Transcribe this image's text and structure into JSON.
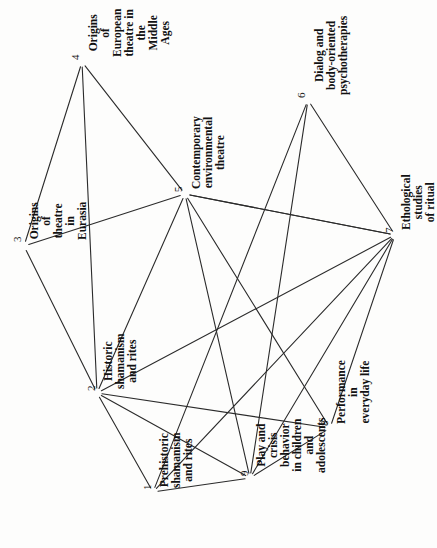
{
  "diagram": {
    "type": "node-link-graph",
    "canvas": {
      "width": 437,
      "height": 548
    },
    "orientation": "labels-rotated-90-ccw",
    "line_color": "#2b2b2b",
    "text_color": "#121212",
    "background": "#fdfdfc",
    "nodes": [
      {
        "id": "1",
        "number": "1",
        "label": "Prehistoric shamanism\nand rites",
        "x": 153,
        "y": 492,
        "num_dx": -12,
        "num_dy": -2,
        "text_dx": 6,
        "text_dy": -4
      },
      {
        "id": "2",
        "number": "2",
        "label": "Historic shamanism\nand rites",
        "x": 97,
        "y": 393,
        "num_dx": -12,
        "num_dy": -2,
        "text_dx": 6,
        "text_dy": -4
      },
      {
        "id": "3",
        "number": "3",
        "label": "Origins of theatre\nin Eurasia",
        "x": 24,
        "y": 246,
        "num_dx": -13,
        "num_dy": -4,
        "text_dx": 5,
        "text_dy": -6
      },
      {
        "id": "4",
        "number": "4",
        "label": "Origins of European\ntheatre in the\nMiddle Ages",
        "x": 82,
        "y": 62,
        "num_dx": -13,
        "num_dy": -2,
        "text_dx": 6,
        "text_dy": -5
      },
      {
        "id": "5",
        "number": "5",
        "label": "Contemporary\nenvironmental theatre",
        "x": 185,
        "y": 194,
        "num_dx": -13,
        "num_dy": -2,
        "text_dx": 6,
        "text_dy": -5
      },
      {
        "id": "6",
        "number": "6",
        "label": "Dialog and body-oriented\npsychotherapies",
        "x": 308,
        "y": 100,
        "num_dx": -13,
        "num_dy": -2,
        "text_dx": 6,
        "text_dy": -5
      },
      {
        "id": "7",
        "number": "7",
        "label": "Ethological studies\nof ritual",
        "x": 395,
        "y": 235,
        "num_dx": -12,
        "num_dy": -2,
        "text_dx": 6,
        "text_dy": -5
      },
      {
        "id": "8",
        "number": "8",
        "label": "Performance in\neveryday life",
        "x": 330,
        "y": 428,
        "num_dx": -12,
        "num_dy": -2,
        "text_dx": 6,
        "text_dy": -4
      },
      {
        "id": "9",
        "number": "9",
        "label": "Play and crisis behavior\nin children and adolescents",
        "x": 250,
        "y": 478,
        "num_dx": -12,
        "num_dy": -2,
        "text_dx": 6,
        "text_dy": -5
      }
    ],
    "edges": [
      {
        "from": "3",
        "to": "4"
      },
      {
        "from": "3",
        "to": "5"
      },
      {
        "from": "3",
        "to": "2"
      },
      {
        "from": "4",
        "to": "5"
      },
      {
        "from": "4",
        "to": "2"
      },
      {
        "from": "5",
        "to": "2"
      },
      {
        "from": "5",
        "to": "9"
      },
      {
        "from": "5",
        "to": "8"
      },
      {
        "from": "5",
        "to": "7"
      },
      {
        "from": "6",
        "to": "7"
      },
      {
        "from": "6",
        "to": "9"
      },
      {
        "from": "6",
        "to": "1"
      },
      {
        "from": "7",
        "to": "2"
      },
      {
        "from": "7",
        "to": "1"
      },
      {
        "from": "7",
        "to": "9"
      },
      {
        "from": "7",
        "to": "8"
      },
      {
        "from": "7",
        "to": "5"
      },
      {
        "from": "2",
        "to": "1"
      },
      {
        "from": "2",
        "to": "9"
      },
      {
        "from": "2",
        "to": "8"
      },
      {
        "from": "1",
        "to": "9"
      },
      {
        "from": "9",
        "to": "8"
      }
    ]
  }
}
